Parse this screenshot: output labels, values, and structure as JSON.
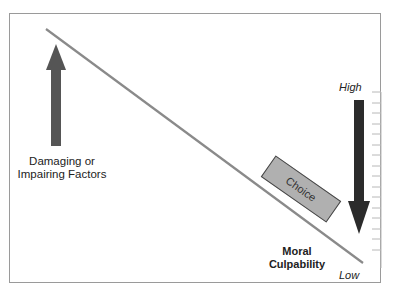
{
  "diagram": {
    "left_arrow": {
      "direction": "up",
      "label_line1": "Damaging or",
      "label_line2": "Impairing Factors",
      "color": "#555555"
    },
    "right_arrow": {
      "direction": "down",
      "color": "#2b2b2b"
    },
    "choice": {
      "label": "Choice",
      "fill": "#b0b0b0"
    },
    "scale": {
      "high_label": "High",
      "low_label": "Low",
      "tick_count": 16
    },
    "axis_label": {
      "line1": "Moral",
      "line2": "Culpability"
    },
    "slope_line_color": "#8a8a8a"
  }
}
